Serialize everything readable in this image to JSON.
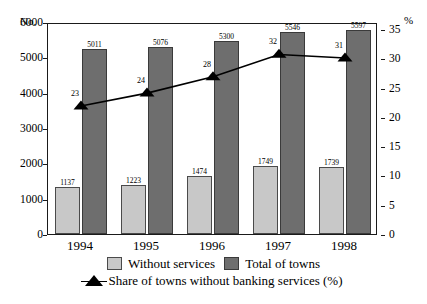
{
  "chart_data": {
    "type": "bar",
    "title": "",
    "subtitle": "",
    "xlabel": "",
    "ylabel": "No.",
    "ylabel_secondary": "%",
    "categories": [
      "1994",
      "1995",
      "1996",
      "1997",
      "1998"
    ],
    "series": [
      {
        "name": "Without services",
        "type": "bar",
        "axis": "left",
        "color": "#c8c8c8",
        "values": [
          1137,
          1223,
          1474,
          1749,
          1739
        ],
        "drawn_values": [
          1330,
          1395,
          1640,
          1915,
          1905
        ]
      },
      {
        "name": "Total of towns",
        "type": "bar",
        "axis": "left",
        "color": "#6e6e6e",
        "values": [
          5011,
          5076,
          5300,
          5546,
          5597
        ],
        "drawn_values": [
          5230,
          5305,
          5470,
          5730,
          5780
        ]
      },
      {
        "name": "Share of towns without banking services (%)",
        "type": "line",
        "axis": "right",
        "color": "#000000",
        "marker": "triangle",
        "values": [
          23,
          24,
          28,
          32,
          31
        ],
        "drawn_values": [
          22.2,
          24.4,
          27.2,
          31.0,
          30.4
        ]
      }
    ],
    "ylim": [
      0,
      6000
    ],
    "yticks": [
      0,
      1000,
      2000,
      3000,
      4000,
      5000,
      6000
    ],
    "ylim_secondary": [
      0,
      36.2
    ],
    "yticks_secondary": [
      0,
      5,
      10,
      15,
      20,
      25,
      30,
      35
    ],
    "grid": false,
    "legend_position": "bottom",
    "data_labels": true
  },
  "axes": {
    "left_caption": "No.",
    "right_caption": "%",
    "left_ticks": [
      "6000",
      "5000",
      "4000",
      "3000",
      "2000",
      "1000",
      "0"
    ],
    "right_ticks": [
      "35",
      "30",
      "25",
      "20",
      "15",
      "10",
      "5",
      "0"
    ],
    "x_ticks": [
      "1994",
      "1995",
      "1996",
      "1997",
      "1998"
    ]
  },
  "labels": {
    "without_services": [
      "1137",
      "1223",
      "1474",
      "1749",
      "1739"
    ],
    "total_of_towns": [
      "5011",
      "5076",
      "5300",
      "5546",
      "5597"
    ],
    "share_pct": [
      "23",
      "24",
      "28",
      "32",
      "31"
    ]
  },
  "legend": {
    "item1": "Without services",
    "item2": "Total of towns",
    "item3": "Share of towns without banking services (%)"
  }
}
